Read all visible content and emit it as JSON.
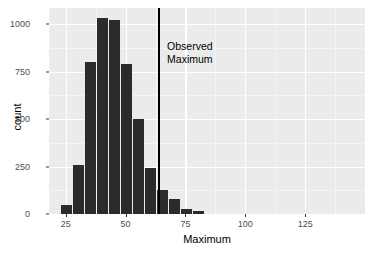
{
  "chart_data": {
    "type": "bar",
    "title": "",
    "subtitle": "",
    "xlabel": "Maximum",
    "ylabel": "count",
    "xlim": [
      18,
      150
    ],
    "ylim": [
      0,
      1085
    ],
    "grid": true,
    "legend": "none",
    "binwidth": 5,
    "categories": [
      "25",
      "30",
      "35",
      "40",
      "45",
      "50",
      "55",
      "60",
      "65",
      "70",
      "75",
      "80",
      "85"
    ],
    "x": [
      25,
      30,
      35,
      40,
      45,
      50,
      55,
      60,
      65,
      70,
      75,
      80,
      85
    ],
    "values": [
      45,
      258,
      800,
      1030,
      1020,
      790,
      500,
      240,
      127,
      77,
      28,
      15,
      0
    ],
    "bars": [
      {
        "center": 25,
        "left": 23,
        "right": 28,
        "count": 45
      },
      {
        "center": 30,
        "left": 28,
        "right": 33,
        "count": 258
      },
      {
        "center": 35,
        "left": 33,
        "right": 38,
        "count": 800
      },
      {
        "center": 40,
        "left": 38,
        "right": 43,
        "count": 1030
      },
      {
        "center": 45,
        "left": 43,
        "right": 48,
        "count": 1020
      },
      {
        "center": 50,
        "left": 48,
        "right": 53,
        "count": 790
      },
      {
        "center": 55,
        "left": 53,
        "right": 58,
        "count": 500
      },
      {
        "center": 60,
        "left": 58,
        "right": 63,
        "count": 240
      },
      {
        "center": 65,
        "left": 63,
        "right": 68,
        "count": 127
      },
      {
        "center": 70,
        "left": 68,
        "right": 73,
        "count": 77
      },
      {
        "center": 75,
        "left": 73,
        "right": 78,
        "count": 28
      },
      {
        "center": 80,
        "left": 78,
        "right": 83,
        "count": 15
      }
    ],
    "yticks": [
      0,
      250,
      500,
      750,
      1000
    ],
    "ytick_labels": [
      "0",
      "250",
      "500",
      "750",
      "1000"
    ],
    "xticks": [
      25,
      50,
      75,
      100,
      125
    ],
    "xtick_labels": [
      "25",
      "50",
      "75",
      "100",
      "125"
    ],
    "annotations": [
      {
        "name": "observed-maximum",
        "line1": "Observed",
        "line2": "Maximum",
        "x_value": 64,
        "type": "vertical-reference-line"
      }
    ],
    "colors": {
      "bar_fill": "#2B2B2B",
      "panel_background": "#EBEBEB",
      "gridline": "#FFFFFF",
      "reference_line": "#000000",
      "axis_text": "#4D4D4D",
      "axis_title": "#000000"
    }
  }
}
